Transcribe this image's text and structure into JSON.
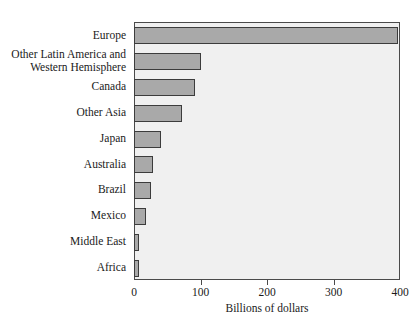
{
  "chart_data": {
    "type": "bar",
    "orientation": "horizontal",
    "title": "",
    "subtitle": "",
    "xlabel": "Billions of dollars",
    "ylabel": "",
    "xlim": [
      0,
      400
    ],
    "xticks": [
      0,
      100,
      200,
      300,
      400
    ],
    "xtick_labels": [
      "0",
      "100",
      "200",
      "300",
      "400"
    ],
    "grid": false,
    "legend": null,
    "categories": [
      "Europe",
      "Other Latin America and\nWestern Hemisphere",
      "Canada",
      "Other Asia",
      "Japan",
      "Australia",
      "Brazil",
      "Mexico",
      "Middle East",
      "Africa"
    ],
    "values": [
      397,
      100,
      91,
      72,
      40,
      28,
      26,
      18,
      8,
      8
    ],
    "bar_color": "#a9a9a9",
    "bar_edge_color": "#3c3c3c",
    "plot_background": "#f0f0f0",
    "axis_color": "#4a4a4a"
  },
  "axis": {
    "x_title": "Billions of dollars"
  },
  "cropped_header": ""
}
